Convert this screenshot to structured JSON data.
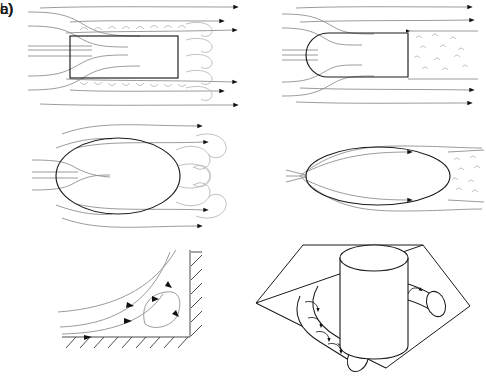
{
  "figure": {
    "background_color": "#ffffff",
    "line_color": "#8e8e8e",
    "body_color": "#1a1a1a",
    "rows": [
      {
        "label": "a)",
        "description": "Two-dimensional rectangular and round-nosed bodies in uniform flow",
        "panels": [
          {
            "name": "blunt-rectangle-panel",
            "body": "rectangle",
            "caption": "Sharp-edged rectangular body with leading-edge separation bubbles and a broad unsteady wake"
          },
          {
            "name": "round-nose-panel",
            "body": "round-nosed rectangle",
            "caption": "Round-nosed body with attached boundary layer and a narrow turbulent trailing-edge wake"
          }
        ]
      },
      {
        "label": "b)",
        "description": "Elliptical cylinders of differing slenderness",
        "panels": [
          {
            "name": "bluff-ellipse-panel",
            "body": "thick ellipse",
            "caption": "Thick ellipse producing large-scale vortex shedding in the near wake"
          },
          {
            "name": "slender-ellipse-panel",
            "body": "slender ellipse",
            "caption": "Slender ellipse with attached flow and a thin turbulent wake"
          }
        ]
      },
      {
        "label": "c)",
        "description": "Corner and junction vortex systems",
        "panels": [
          {
            "name": "corner-vortex-panel",
            "body": "hatched concave corner",
            "caption": "Streamlines turning in a concave corner enclosing a closed recirculation vortex"
          },
          {
            "name": "horseshoe-vortex-panel",
            "body": "cylinder on flat plate",
            "caption": "Horseshoe vortex wrapping around the base of a cylinder mounted on a flat plate"
          }
        ]
      }
    ],
    "annotations": {
      "flow_direction": "left to right",
      "arrow_marker": "solid triangular flow arrow",
      "hatching": "wall hatching indicates solid boundary"
    }
  }
}
